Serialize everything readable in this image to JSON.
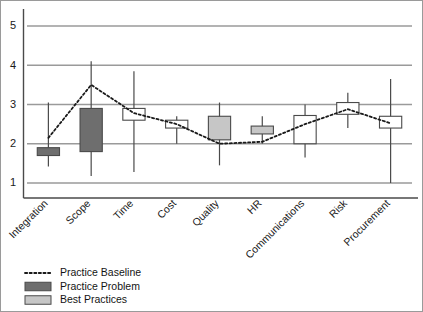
{
  "chart_data": {
    "type": "bar",
    "title": "",
    "subtitle": "",
    "xlabel": "",
    "ylabel": "",
    "ylim": [
      0.7,
      5.4
    ],
    "yticks": [
      1,
      2,
      3,
      4,
      5
    ],
    "ytick_labels": [
      "1",
      "2",
      "3",
      "4",
      "5"
    ],
    "grid": true,
    "grid_axis": "y",
    "legend_position": "bottom-left",
    "categories": [
      "Integration",
      "Scope",
      "Time",
      "Cost",
      "Quality",
      "HR",
      "Communications",
      "Risk",
      "Procurement"
    ],
    "series": [
      {
        "name": "Practice Baseline",
        "type": "line",
        "style": "dotted",
        "color": "#1a1a1a",
        "values": [
          2.15,
          3.5,
          2.78,
          2.5,
          2.0,
          2.05,
          2.5,
          2.88,
          2.52
        ]
      },
      {
        "name": "Box range (low-high)",
        "type": "box",
        "box_low": [
          1.7,
          1.8,
          2.6,
          2.4,
          2.1,
          2.25,
          2.0,
          2.75,
          2.4
        ],
        "box_high": [
          1.9,
          2.9,
          2.9,
          2.6,
          2.7,
          2.45,
          2.72,
          3.05,
          2.7
        ],
        "fill": [
          "dark",
          "dark",
          "white",
          "white",
          "light",
          "light",
          "white",
          "white",
          "white"
        ]
      },
      {
        "name": "Whisker range (min-max)",
        "type": "whisker",
        "whisker_low": [
          1.42,
          1.18,
          1.28,
          2.0,
          1.45,
          2.0,
          1.65,
          2.4,
          1.0
        ],
        "whisker_high": [
          3.05,
          4.1,
          3.85,
          2.7,
          3.05,
          2.7,
          3.0,
          3.3,
          3.65
        ]
      }
    ]
  },
  "legend": {
    "items": [
      {
        "label": "Practice Baseline",
        "swatch": "dotted-line",
        "color": "#1a1a1a"
      },
      {
        "label": "Practice Problem",
        "swatch": "box",
        "color": "#6e6e6e"
      },
      {
        "label": "Best Practices",
        "swatch": "box",
        "color": "#c6c6c6"
      }
    ]
  },
  "colors": {
    "grid": "#9a9a9a",
    "axis": "#4a4a4a",
    "border": "#9a9a9a",
    "practice_problem": "#6e6e6e",
    "best_practices": "#c6c6c6",
    "white_box": "#ffffff",
    "box_edge": "#4a4a4a",
    "baseline": "#1a1a1a"
  }
}
